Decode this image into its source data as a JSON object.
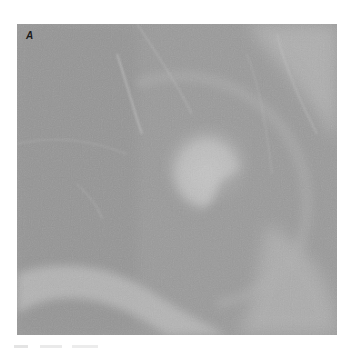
{
  "figure": {
    "panel_label": "A",
    "colors": {
      "background": "#9b9b9b",
      "light_tissue": "#c4c4c4",
      "dark_tissue": "#8a8a8a",
      "page": "#ffffff"
    }
  }
}
